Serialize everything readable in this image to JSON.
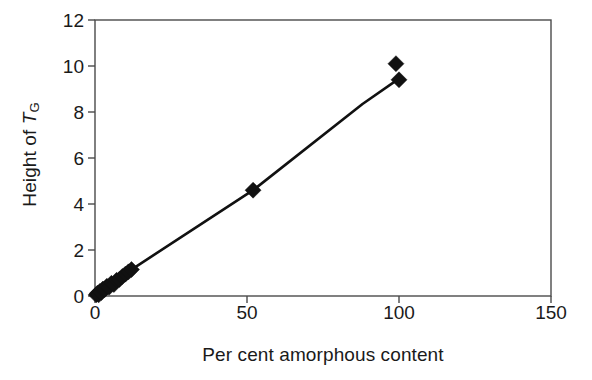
{
  "chart_data": {
    "type": "scatter",
    "title": "",
    "xlabel": "Per cent amorphous content",
    "ylabel_plain": "Height of TG",
    "ylabel_parts": {
      "prefix": "Height of ",
      "symbol": "T",
      "subscript": "G"
    },
    "xlim": [
      0,
      150
    ],
    "ylim": [
      0,
      12
    ],
    "xticks": [
      0,
      50,
      100,
      150
    ],
    "xtick_labels": [
      "0",
      "50",
      "100",
      "150"
    ],
    "yticks": [
      0,
      2,
      4,
      6,
      8,
      10,
      12
    ],
    "ytick_labels": [
      "0",
      "2",
      "4",
      "6",
      "8",
      "10",
      "12"
    ],
    "grid": false,
    "legend": null,
    "marker": "filled-diamond",
    "marker_color": "#111111",
    "line_color": "#111111",
    "points": [
      {
        "x": 0.4,
        "y": 0.05
      },
      {
        "x": 0.8,
        "y": 0.12
      },
      {
        "x": 1.2,
        "y": 0.05
      },
      {
        "x": 1.6,
        "y": 0.2
      },
      {
        "x": 2.1,
        "y": 0.15
      },
      {
        "x": 2.6,
        "y": 0.3
      },
      {
        "x": 3.2,
        "y": 0.28
      },
      {
        "x": 3.9,
        "y": 0.42
      },
      {
        "x": 4.6,
        "y": 0.38
      },
      {
        "x": 5.4,
        "y": 0.55
      },
      {
        "x": 6.2,
        "y": 0.5
      },
      {
        "x": 7.1,
        "y": 0.68
      },
      {
        "x": 8.0,
        "y": 0.72
      },
      {
        "x": 9.0,
        "y": 0.85
      },
      {
        "x": 10.0,
        "y": 0.95
      },
      {
        "x": 11.0,
        "y": 1.05
      },
      {
        "x": 12.0,
        "y": 1.15
      },
      {
        "x": 52.0,
        "y": 4.6
      },
      {
        "x": 99.0,
        "y": 10.1
      },
      {
        "x": 100.0,
        "y": 9.4
      }
    ],
    "trend_line": [
      {
        "x": 0.0,
        "y": 0.0
      },
      {
        "x": 12.0,
        "y": 1.15
      },
      {
        "x": 52.0,
        "y": 4.6
      },
      {
        "x": 88.0,
        "y": 8.35
      },
      {
        "x": 100.0,
        "y": 9.45
      }
    ]
  }
}
